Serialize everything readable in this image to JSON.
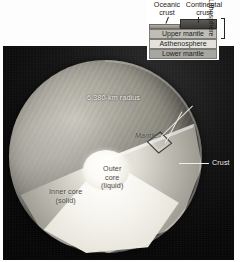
{
  "figure": {
    "radius_label": "6,380-km radius"
  },
  "earth_labels": {
    "mantle": "Mantle",
    "outer_core": "Outer\ncore\n(liquid)",
    "inner_core": "Inner core\n(solid)",
    "crust": "Crust"
  },
  "inset": {
    "oceanic_crust": "Oceanic\ncrust",
    "continental_crust": "Continental\ncrust",
    "layers": [
      {
        "label": "Upper mantle",
        "color": "#bfbdb6"
      },
      {
        "label": "Asthenosphere",
        "color": "#e4e2dc"
      },
      {
        "label": "Lower mantle",
        "color": "#a8a6a0"
      }
    ],
    "bracket_label": "Lithosphere"
  },
  "colors": {
    "background": "#0a0a0a",
    "inner_core": "#ffffff",
    "outer_core": "#eceadf",
    "mantle": "#b9b6ad",
    "crust_rim": "#f5f3ec",
    "label_text": "#f2f1ec"
  }
}
